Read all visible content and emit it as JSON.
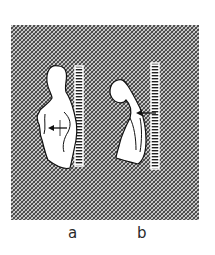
{
  "figure": {
    "background_pattern": "cross-hatch",
    "colors": {
      "hatch": "#3a3a3a",
      "hatch_bg": "#d9d9d9",
      "silhouette_fill": "#ffffff",
      "outline": "#111111",
      "page": "#ffffff"
    },
    "panels": [
      {
        "id": "a",
        "label": "a",
        "description": "upright figure standing against ruled wall, arrow pointing to lower back"
      },
      {
        "id": "b",
        "label": "b",
        "description": "stooped figure leaning against ruled wall, arrow pointing to lower back"
      }
    ]
  }
}
